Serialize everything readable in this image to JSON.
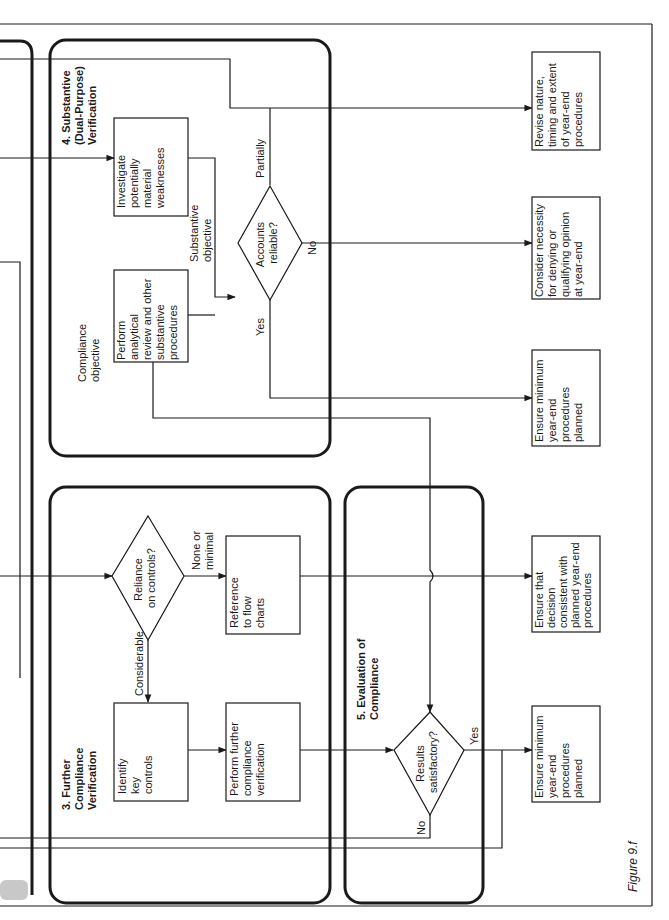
{
  "figure_label": "Figure 9.f",
  "sections": {
    "substantive": {
      "title": [
        "4. Substantive",
        "(Dual-Purpose)",
        "Verification"
      ]
    },
    "further_compliance": {
      "title": [
        "3. Further",
        "Compliance",
        "Verification"
      ]
    },
    "evaluation": {
      "title": [
        "5. Evaluation of",
        "Compliance"
      ]
    }
  },
  "nodes": {
    "investigate": [
      "Investigate",
      "potentially",
      "material",
      "weaknesses"
    ],
    "perform_analytical": [
      "Perform",
      "analytical",
      "review and other",
      "substantive",
      "procedures"
    ],
    "accounts_reliable": [
      "Accounts",
      "reliable?"
    ],
    "reliance_on_controls": [
      "Reliance",
      "on controls?"
    ],
    "reference_flow_charts": [
      "Reference",
      "to flow",
      "charts"
    ],
    "identify_key_controls": [
      "Identify",
      "key",
      "controls"
    ],
    "perform_further": [
      "Perform further",
      "compliance",
      "verification"
    ],
    "results_satisfactory": [
      "Results",
      "satisfactory?"
    ],
    "revise_nature": [
      "Revise nature,",
      "timing and extent",
      "of year-end",
      "procedures"
    ],
    "consider_necessity": [
      "Consider necessity",
      "for denying or",
      "qualifying opinion",
      "at year-end"
    ],
    "ensure_minimum_top": [
      "Ensure minimum",
      "year-end",
      "procedures",
      "planned"
    ],
    "ensure_decision": [
      "Ensure that",
      "decision",
      "consistent with",
      "planned year-end",
      "procedures"
    ],
    "ensure_minimum_bottom": [
      "Ensure minimum",
      "year-end",
      "procedures",
      "planned"
    ]
  },
  "edge_labels": {
    "partially": "Partially",
    "no_accounts": "No",
    "yes_accounts": "Yes",
    "substantive_objective": [
      "Substantive",
      "objective"
    ],
    "compliance_objective": [
      "Compliance",
      "objective"
    ],
    "none_or_minimal": [
      "None or",
      "minimal"
    ],
    "considerable": "Considerable",
    "yes_results": "Yes",
    "no_results": "No"
  },
  "colors": {
    "ink": "#1a1a1a",
    "paper": "#ffffff",
    "tab": "#c8c8c8"
  }
}
